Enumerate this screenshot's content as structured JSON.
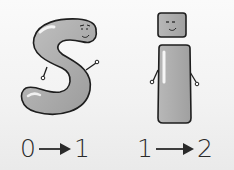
{
  "characters": [
    {
      "name": "S",
      "glyph": "S",
      "mapping": {
        "from": "0",
        "to": "1"
      }
    },
    {
      "name": "i",
      "glyph": "i",
      "mapping": {
        "from": "1",
        "to": "2"
      }
    }
  ],
  "icons": {
    "arrow": "right-arrow"
  },
  "colors": {
    "body_fill": "#a9a9a9",
    "outline": "#1e1e1e",
    "highlight": "#efefef",
    "background": "#f4f4f4"
  }
}
